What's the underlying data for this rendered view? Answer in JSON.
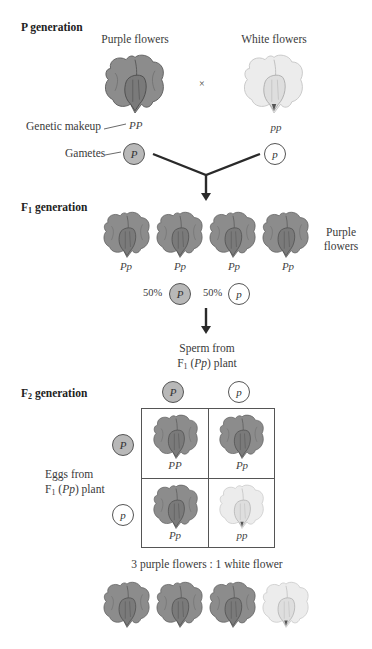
{
  "p_generation": {
    "heading": "P generation",
    "parents": [
      {
        "label": "Purple flowers",
        "genotype": "PP",
        "gamete": "P",
        "color": "purple"
      },
      {
        "label": "White flowers",
        "genotype": "pp",
        "gamete": "p",
        "color": "white"
      }
    ],
    "cross_symbol": "×",
    "genetic_makeup_label": "Genetic makeup",
    "gametes_label": "Gametes"
  },
  "f1_generation": {
    "heading_main": "F",
    "heading_sub": "1",
    "heading_rest": " generation",
    "offspring": [
      {
        "genotype": "Pp"
      },
      {
        "genotype": "Pp"
      },
      {
        "genotype": "Pp"
      },
      {
        "genotype": "Pp"
      }
    ],
    "phenotype_line1": "Purple",
    "phenotype_line2": "flowers",
    "gametes": [
      {
        "percent": "50%",
        "allele": "P"
      },
      {
        "percent": "50%",
        "allele": "p"
      }
    ]
  },
  "sperm_label": {
    "line1": "Sperm from",
    "line2_prefix": "F",
    "line2_sub": "1",
    "line2_open": " (",
    "line2_geno": "Pp",
    "line2_close": ") plant"
  },
  "f2_generation": {
    "heading_main": "F",
    "heading_sub": "2",
    "heading_rest": " generation",
    "sperm_alleles": [
      "P",
      "p"
    ],
    "egg_alleles": [
      "P",
      "p"
    ],
    "eggs_label": {
      "line1": "Eggs from",
      "line2_prefix": "F",
      "line2_sub": "1",
      "line2_open": " (",
      "line2_geno": "Pp",
      "line2_close": ") plant"
    },
    "punnett": [
      [
        {
          "genotype": "PP",
          "color": "purple"
        },
        {
          "genotype": "Pp",
          "color": "purple"
        }
      ],
      [
        {
          "genotype": "Pp",
          "color": "purple"
        },
        {
          "genotype": "pp",
          "color": "white"
        }
      ]
    ],
    "ratio_text": "3 purple flowers : 1 white flower",
    "result_flowers": [
      "purple",
      "purple",
      "purple",
      "white"
    ]
  },
  "colors": {
    "dominant_gamete_fill": "#b8b8b8",
    "purple_flower": "#8a8a8a",
    "white_flower": "#e6e6e6",
    "line": "#2a2a2a"
  }
}
